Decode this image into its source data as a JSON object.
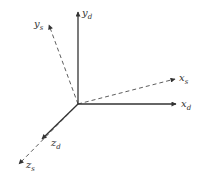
{
  "diagram": {
    "type": "coordinate-frames",
    "origin": [
      78,
      104
    ],
    "colors": {
      "line": "#333333",
      "background": "#ffffff"
    },
    "axes": [
      {
        "id": "y_d",
        "base": "y",
        "sub": "d",
        "style": "solid",
        "end": [
          78,
          12
        ],
        "label_pos": [
          82,
          16
        ]
      },
      {
        "id": "y_s",
        "base": "y",
        "sub": "s",
        "style": "dashed",
        "end": [
          49,
          25
        ],
        "label_pos": [
          34,
          27
        ]
      },
      {
        "id": "x_s",
        "base": "x",
        "sub": "s",
        "style": "dashed",
        "end": [
          175,
          79
        ],
        "label_pos": [
          179,
          81
        ]
      },
      {
        "id": "x_d",
        "base": "x",
        "sub": "d",
        "style": "solid",
        "end": [
          176,
          104
        ],
        "label_pos": [
          181,
          107
        ]
      },
      {
        "id": "z_d",
        "base": "z",
        "sub": "d",
        "style": "solid",
        "end": [
          42,
          139
        ],
        "label_pos": [
          51,
          146
        ]
      },
      {
        "id": "z_s",
        "base": "z",
        "sub": "s",
        "style": "dashed",
        "end": [
          19,
          164
        ],
        "label_pos": [
          26,
          168
        ]
      }
    ]
  }
}
